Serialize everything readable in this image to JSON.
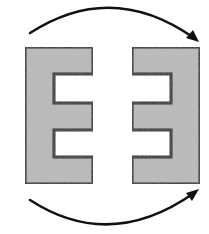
{
  "diagram": {
    "colors": {
      "background": "#ffffff",
      "shape_fill": "#bcbcbc",
      "stroke": "#111111"
    },
    "shapes": [
      {
        "name": "left-e-shape",
        "orientation": "E-shape opening to the right",
        "points": "25,47 93,47 93,74 54,74 54,103 93,103 93,130 54,130 54,157 93,157 93,184 25,184"
      },
      {
        "name": "right-e-shape",
        "orientation": "mirrored E-shape opening to the left",
        "points": "132,47 200,47 200,184 132,184 132,157 171,157 171,130 132,130 132,103 171,103 171,74 132,74"
      }
    ],
    "arrows": [
      {
        "name": "top-arrow",
        "direction": "left-to-right, arcing over the top",
        "path": "M30,33 Q112,-20 194,38",
        "head": "199,42 186,38 193,30"
      },
      {
        "name": "bottom-arrow",
        "direction": "left-to-right, arcing underneath",
        "path": "M30,200 Q110,252 194,193",
        "head": "199,189 192,201 186,193"
      }
    ]
  }
}
